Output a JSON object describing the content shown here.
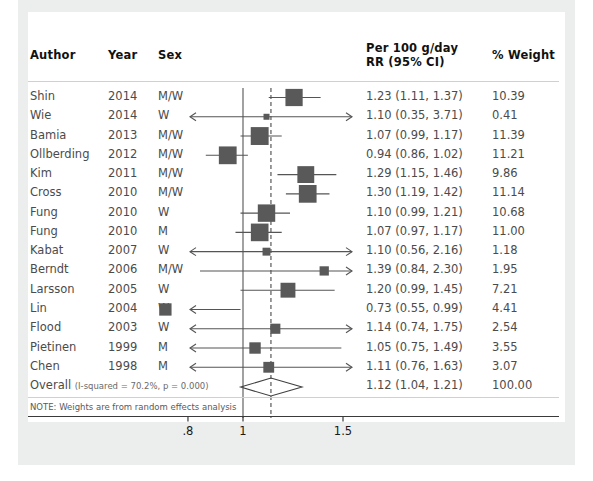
{
  "figure": {
    "columns": {
      "author": "Author",
      "year": "Year",
      "sex": "Sex",
      "effect": "Per 100 g/day\nRR (95% CI)",
      "effect_line1": "Per 100 g/day",
      "effect_line2": "RR (95% CI)",
      "weight": "% Weight"
    },
    "overall_label": "Overall",
    "heterogeneity": "(I-squared = 70.2%, p = 0.000)",
    "note": "NOTE: Weights are from random effects analysis",
    "colors": {
      "panel_background": "#ffffff",
      "figure_background": "#eceded",
      "marker": "#595959",
      "line": "#555555",
      "text": "#4b4b4b",
      "header_text": "#111111"
    }
  },
  "chart_data": {
    "type": "forest",
    "title": "",
    "xlabel": "",
    "ylabel": "",
    "xlim": [
      0.7,
      1.75
    ],
    "xticks": [
      0.8,
      1.0,
      1.5
    ],
    "xtick_labels": [
      ".8",
      "1",
      "1.5"
    ],
    "xscale": "log",
    "reference_line": 1.0,
    "pooled_line": 1.12,
    "grid": false,
    "legend": "none",
    "effect_measure": "RR (95% CI)",
    "exposure": "Per 100 g/day",
    "studies": [
      {
        "author": "Shin",
        "year": "2014",
        "sex": "M/W",
        "rr": 1.23,
        "lci": 1.11,
        "uci": 1.37,
        "label": "1.23 (1.11, 1.37)",
        "weight": 10.39,
        "weight_label": "10.39",
        "left_truncated": false,
        "right_truncated": false
      },
      {
        "author": "Wie",
        "year": "2014",
        "sex": "W",
        "rr": 1.1,
        "lci": 0.35,
        "uci": 3.71,
        "label": "1.10 (0.35, 3.71)",
        "weight": 0.41,
        "weight_label": "0.41",
        "left_truncated": true,
        "right_truncated": true
      },
      {
        "author": "Bamia",
        "year": "2013",
        "sex": "M/W",
        "rr": 1.07,
        "lci": 0.99,
        "uci": 1.17,
        "label": "1.07 (0.99, 1.17)",
        "weight": 11.39,
        "weight_label": "11.39",
        "left_truncated": false,
        "right_truncated": false
      },
      {
        "author": "Ollberding",
        "year": "2012",
        "sex": "M/W",
        "rr": 0.94,
        "lci": 0.86,
        "uci": 1.02,
        "label": "0.94 (0.86, 1.02)",
        "weight": 11.21,
        "weight_label": "11.21",
        "left_truncated": false,
        "right_truncated": false
      },
      {
        "author": "Kim",
        "year": "2011",
        "sex": "M/W",
        "rr": 1.29,
        "lci": 1.15,
        "uci": 1.46,
        "label": "1.29 (1.15, 1.46)",
        "weight": 9.86,
        "weight_label": "9.86",
        "left_truncated": false,
        "right_truncated": false
      },
      {
        "author": "Cross",
        "year": "2010",
        "sex": "M/W",
        "rr": 1.3,
        "lci": 1.19,
        "uci": 1.42,
        "label": "1.30 (1.19, 1.42)",
        "weight": 11.14,
        "weight_label": "11.14",
        "left_truncated": false,
        "right_truncated": false
      },
      {
        "author": "Fung",
        "year": "2010",
        "sex": "W",
        "rr": 1.1,
        "lci": 0.99,
        "uci": 1.21,
        "label": "1.10 (0.99, 1.21)",
        "weight": 10.68,
        "weight_label": "10.68",
        "left_truncated": false,
        "right_truncated": false
      },
      {
        "author": "Fung",
        "year": "2010",
        "sex": "M",
        "rr": 1.07,
        "lci": 0.97,
        "uci": 1.17,
        "label": "1.07 (0.97, 1.17)",
        "weight": 11.0,
        "weight_label": "11.00",
        "left_truncated": false,
        "right_truncated": false
      },
      {
        "author": "Kabat",
        "year": "2007",
        "sex": "W",
        "rr": 1.1,
        "lci": 0.56,
        "uci": 2.16,
        "label": "1.10 (0.56, 2.16)",
        "weight": 1.18,
        "weight_label": "1.18",
        "left_truncated": true,
        "right_truncated": true
      },
      {
        "author": "Berndt",
        "year": "2006",
        "sex": "M/W",
        "rr": 1.39,
        "lci": 0.84,
        "uci": 2.3,
        "label": "1.39 (0.84, 2.30)",
        "weight": 1.95,
        "weight_label": "1.95",
        "left_truncated": false,
        "right_truncated": true
      },
      {
        "author": "Larsson",
        "year": "2005",
        "sex": "W",
        "rr": 1.2,
        "lci": 0.99,
        "uci": 1.45,
        "label": "1.20 (0.99, 1.45)",
        "weight": 7.21,
        "weight_label": "7.21",
        "left_truncated": false,
        "right_truncated": false
      },
      {
        "author": "Lin",
        "year": "2004",
        "sex": "W",
        "rr": 0.73,
        "lci": 0.55,
        "uci": 0.99,
        "label": "0.73 (0.55, 0.99)",
        "weight": 4.41,
        "weight_label": "4.41",
        "left_truncated": true,
        "right_truncated": false
      },
      {
        "author": "Flood",
        "year": "2003",
        "sex": "W",
        "rr": 1.14,
        "lci": 0.74,
        "uci": 1.75,
        "label": "1.14 (0.74, 1.75)",
        "weight": 2.54,
        "weight_label": "2.54",
        "left_truncated": true,
        "right_truncated": true
      },
      {
        "author": "Pietinen",
        "year": "1999",
        "sex": "M",
        "rr": 1.05,
        "lci": 0.75,
        "uci": 1.49,
        "label": "1.05 (0.75, 1.49)",
        "weight": 3.55,
        "weight_label": "3.55",
        "left_truncated": true,
        "right_truncated": false
      },
      {
        "author": "Chen",
        "year": "1998",
        "sex": "M",
        "rr": 1.11,
        "lci": 0.76,
        "uci": 1.63,
        "label": "1.11 (0.76, 1.63)",
        "weight": 3.07,
        "weight_label": "3.07",
        "left_truncated": true,
        "right_truncated": true
      }
    ],
    "overall": {
      "author": "Overall",
      "rr": 1.12,
      "lci": 1.04,
      "uci": 1.21,
      "label": "1.12 (1.04, 1.21)",
      "weight": 100.0,
      "weight_label": "100.00"
    }
  }
}
